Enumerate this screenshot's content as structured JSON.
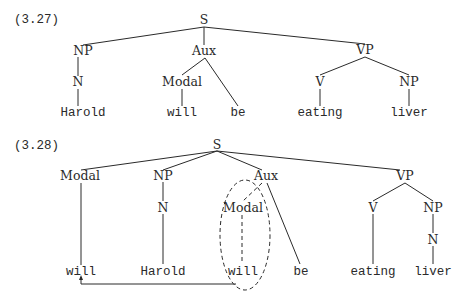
{
  "colors": {
    "ink": "#2a2a2a",
    "background": "#ffffff"
  },
  "trees": [
    {
      "example_number": "(3.27)",
      "nodes": {
        "S": "S",
        "NP": "NP",
        "Aux": "Aux",
        "VP": "VP",
        "N": "N",
        "Modal": "Modal",
        "V": "V",
        "NP2": "NP",
        "Harold": "Harold",
        "will": "will",
        "be": "be",
        "eating": "eating",
        "liver": "liver"
      }
    },
    {
      "example_number": "(3.28)",
      "nodes": {
        "S": "S",
        "Modal_moved": "Modal",
        "NP": "NP",
        "Aux": "Aux",
        "VP": "VP",
        "N": "N",
        "Modal_trace": "Modal",
        "V": "V",
        "NP2": "NP",
        "N2": "N",
        "will_moved": "will",
        "Harold": "Harold",
        "will_trace": "will",
        "be": "be",
        "eating": "eating",
        "liver": "liver"
      },
      "annotations": {
        "dashed_ellipse": "encircles original Modal/will position",
        "movement_arrow": "from original will to fronted will"
      }
    }
  ]
}
